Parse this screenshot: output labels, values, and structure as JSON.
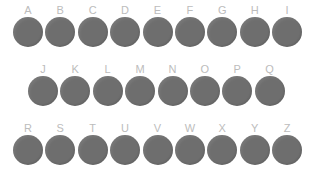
{
  "page": {
    "background_color": "#ffffff"
  },
  "style": {
    "circle_color": "#6e6e6e",
    "label_color": "#bcbcbc",
    "circle_diameter_px": 30
  },
  "grid": {
    "rows": [
      {
        "row_index": 0,
        "indented": false,
        "items": [
          {
            "label": "A",
            "shape": "circle-filled"
          },
          {
            "label": "B",
            "shape": "circle-filled"
          },
          {
            "label": "C",
            "shape": "circle-filled"
          },
          {
            "label": "D",
            "shape": "circle-filled"
          },
          {
            "label": "E",
            "shape": "circle-filled"
          },
          {
            "label": "F",
            "shape": "circle-filled"
          },
          {
            "label": "G",
            "shape": "circle-filled"
          },
          {
            "label": "H",
            "shape": "circle-filled"
          },
          {
            "label": "I",
            "shape": "circle-filled"
          }
        ]
      },
      {
        "row_index": 1,
        "indented": true,
        "items": [
          {
            "label": "J",
            "shape": "circle-filled"
          },
          {
            "label": "K",
            "shape": "circle-filled"
          },
          {
            "label": "L",
            "shape": "circle-filled"
          },
          {
            "label": "M",
            "shape": "circle-filled"
          },
          {
            "label": "N",
            "shape": "circle-filled"
          },
          {
            "label": "O",
            "shape": "circle-filled"
          },
          {
            "label": "P",
            "shape": "circle-filled"
          },
          {
            "label": "Q",
            "shape": "circle-filled"
          }
        ]
      },
      {
        "row_index": 2,
        "indented": false,
        "items": [
          {
            "label": "R",
            "shape": "circle-filled"
          },
          {
            "label": "S",
            "shape": "circle-filled"
          },
          {
            "label": "T",
            "shape": "circle-filled"
          },
          {
            "label": "U",
            "shape": "circle-filled"
          },
          {
            "label": "V",
            "shape": "circle-filled"
          },
          {
            "label": "W",
            "shape": "circle-filled"
          },
          {
            "label": "X",
            "shape": "circle-filled"
          },
          {
            "label": "Y",
            "shape": "circle-filled"
          },
          {
            "label": "Z",
            "shape": "circle-filled"
          }
        ]
      }
    ]
  }
}
